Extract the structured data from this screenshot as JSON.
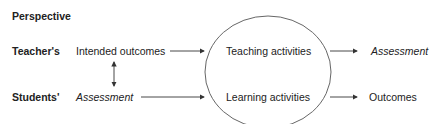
{
  "diagram": {
    "header": "Perspective",
    "rows": [
      {
        "label": "Teacher's",
        "input": "Intended outcomes",
        "activity": "Teaching activities",
        "output": "Assessment",
        "output_italic": true
      },
      {
        "label": "Students'",
        "input": "Assessment",
        "input_italic": true,
        "activity": "Learning activities",
        "output": "Outcomes"
      }
    ],
    "connectors": [
      {
        "from": "Intended outcomes",
        "to": "Assessment",
        "type": "double-arrow-vertical"
      },
      {
        "from": "Intended outcomes",
        "to": "Teaching activities",
        "type": "arrow"
      },
      {
        "from": "Assessment",
        "to": "Learning activities",
        "type": "arrow"
      },
      {
        "from": "Teaching activities",
        "to": "Assessment",
        "type": "arrow"
      },
      {
        "from": "Learning activities",
        "to": "Outcomes",
        "type": "arrow"
      }
    ],
    "colors": {
      "line": "#444444",
      "text": "#222222"
    }
  }
}
